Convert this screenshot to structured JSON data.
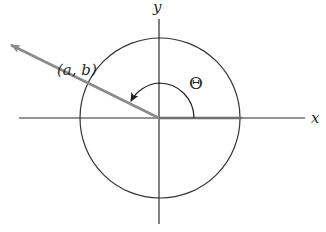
{
  "diagram": {
    "type": "unit-circle-angle",
    "labels": {
      "x_axis": "x",
      "y_axis": "y",
      "point": "(a, b)",
      "angle": "Θ"
    },
    "colors": {
      "axis": "#2b2b2b",
      "circle": "#333333",
      "ray": "#8a8a8a",
      "initial_side": "#707070",
      "background": "#ffffff"
    }
  }
}
